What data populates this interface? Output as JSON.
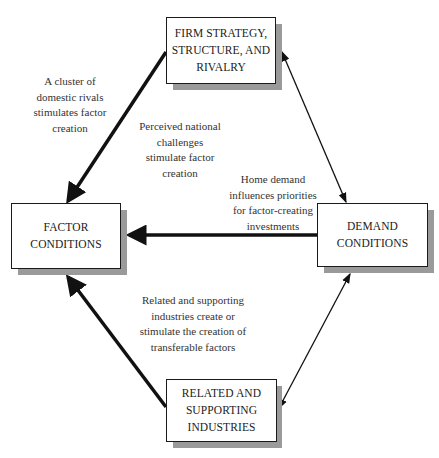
{
  "nodes": {
    "firm": {
      "lines": [
        "FIRM STRATEGY,",
        "STRUCTURE, AND",
        "RIVALRY"
      ]
    },
    "factor": {
      "lines": [
        "FACTOR",
        "CONDITIONS"
      ]
    },
    "demand": {
      "lines": [
        "DEMAND",
        "CONDITIONS"
      ]
    },
    "related": {
      "lines": [
        "RELATED AND",
        "SUPPORTING",
        "INDUSTRIES"
      ]
    }
  },
  "edges": [
    {
      "from": "firm",
      "to": "factor",
      "style": "thick",
      "arrow": "end"
    },
    {
      "from": "demand",
      "to": "factor",
      "style": "thick",
      "arrow": "end"
    },
    {
      "from": "related",
      "to": "factor",
      "style": "thick",
      "arrow": "end"
    },
    {
      "from": "firm",
      "to": "demand",
      "style": "thin",
      "arrow": "both"
    },
    {
      "from": "demand",
      "to": "related",
      "style": "thin",
      "arrow": "both"
    }
  ],
  "annotations": {
    "domestic_rivals": [
      "A cluster of",
      "domestic rivals",
      "stimulates factor",
      "creation"
    ],
    "national_challenges": [
      "Perceived national",
      "challenges",
      "stimulate factor",
      "creation"
    ],
    "home_demand": [
      "Home demand",
      "influences priorities",
      "for factor-creating",
      "investments"
    ],
    "related_industries": [
      "Related and supporting",
      "industries create or",
      "stimulate the creation of",
      "transferable factors"
    ]
  },
  "colors": {
    "line": "#111111",
    "shadow": "#9a9a9a",
    "box_fill": "#ffffff"
  }
}
